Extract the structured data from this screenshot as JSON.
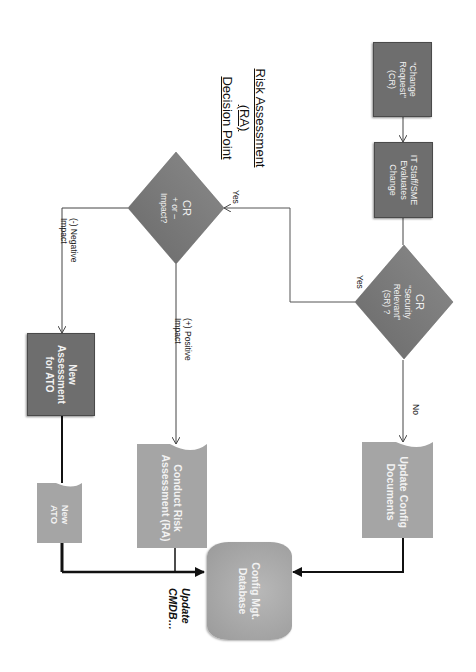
{
  "diagram": {
    "title": {
      "line1": "Risk Assessment",
      "line2": "(RA)",
      "line3": "Decision Point"
    },
    "nodes": {
      "change_request": {
        "label": "\"Change\nRequest\"\n(CR)",
        "shape": "process"
      },
      "it_staff": {
        "label": "IT Staff/SME\nEvaluates\nChange",
        "shape": "process"
      },
      "security_relevant": {
        "title": "CR",
        "label": "\"Security\nRelevant\"\n(SR) ?",
        "shape": "decision"
      },
      "impact": {
        "title": "CR",
        "label": "+ or –\nImpact?",
        "shape": "decision"
      },
      "new_assessment": {
        "label": "New\nAssessment\nfor ATO",
        "shape": "process"
      },
      "new_ato": {
        "label": "New\nATO",
        "shape": "document"
      },
      "conduct_risk": {
        "label": "Conduct Risk\nAssessment (RA)",
        "shape": "document"
      },
      "update_config_docs": {
        "label": "Update Config\nDocuments",
        "shape": "document"
      },
      "config_db": {
        "label": "Config Mgt.\nDatabase",
        "shape": "database"
      }
    },
    "edge_labels": {
      "sr_yes": "Yes",
      "impact_yes": "Yes",
      "sr_no": "No",
      "negative": "(-) Negative\nImpact",
      "positive": "(+) Positive\nImpact",
      "update_cmdb": "Update\nCMDB…"
    },
    "orientation": "rotated 90° clockwise",
    "colors": {
      "process_fill": "#6e6e6e",
      "document_fill": "#a8a8a8",
      "decision_fill": "#7a7a7a",
      "line": "#333333",
      "text_on_shape": "#f2f2f2"
    }
  }
}
